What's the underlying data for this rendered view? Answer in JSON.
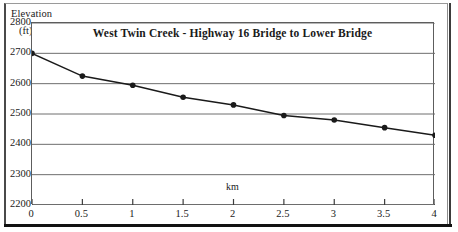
{
  "chart_data": {
    "type": "line",
    "title": "West Twin Creek - Highway 16 Bridge to Lower Bridge",
    "xlabel": "km",
    "ylabel": "Elevation",
    "ylabel_unit": "(ft)",
    "x": [
      0,
      0.5,
      1,
      1.5,
      2,
      2.5,
      3,
      3.5,
      4
    ],
    "values": [
      2700,
      2625,
      2595,
      2555,
      2530,
      2495,
      2480,
      2455,
      2430
    ],
    "series": [
      {
        "name": "Elevation profile",
        "values": [
          2700,
          2625,
          2595,
          2555,
          2530,
          2495,
          2480,
          2455,
          2430
        ]
      }
    ],
    "xlim": [
      0,
      4
    ],
    "ylim": [
      2200,
      2800
    ],
    "xticks": [
      "0",
      "0.5",
      "1",
      "1.5",
      "2",
      "2.5",
      "3",
      "3.5",
      "4"
    ],
    "yticks": [
      "2800",
      "2700",
      "2600",
      "2500",
      "2400",
      "2300",
      "2200"
    ],
    "grid": "horizontal",
    "legend": "none",
    "marker": "filled-circle",
    "line_color": "#1a1a1a",
    "grid_color": "#6e6e6e"
  }
}
